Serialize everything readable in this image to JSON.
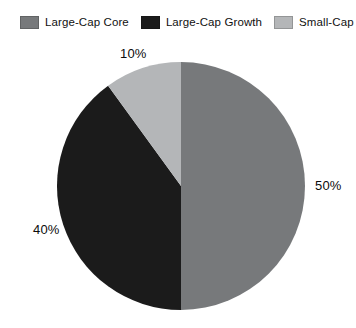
{
  "chart_data": {
    "type": "pie",
    "title": "",
    "subtitle": "",
    "xlabel": "",
    "ylabel": "",
    "legend_position": "top",
    "grid": false,
    "categories": [
      "Large-Cap Core",
      "Large-Cap Growth",
      "Small-Cap"
    ],
    "values": [
      50,
      40,
      10
    ],
    "value_labels": [
      "50%",
      "40%",
      "10%"
    ],
    "colors": [
      "#77797b",
      "#1b1b1b",
      "#b4b6b8"
    ],
    "start_angle_deg": 0,
    "direction": "clockwise",
    "slices": [
      {
        "name": "Large-Cap Core",
        "value": 50,
        "label": "50%",
        "color": "#77797b",
        "start_deg": 0,
        "end_deg": 180
      },
      {
        "name": "Large-Cap Growth",
        "value": 40,
        "label": "40%",
        "color": "#1b1b1b",
        "start_deg": 180,
        "end_deg": 324
      },
      {
        "name": "Small-Cap",
        "value": 10,
        "label": "10%",
        "color": "#b4b6b8",
        "start_deg": 324,
        "end_deg": 360
      }
    ]
  },
  "legend": {
    "items": [
      {
        "label": "Large-Cap Core",
        "color": "#77797b"
      },
      {
        "label": "Large-Cap Growth",
        "color": "#1b1b1b"
      },
      {
        "label": "Small-Cap",
        "color": "#b4b6b8"
      }
    ]
  },
  "labels": {
    "small_cap": "10%",
    "large_cap_core": "50%",
    "large_cap_growth": "40%"
  },
  "geometry": {
    "center_x": 181,
    "center_y": 186,
    "radius": 124
  }
}
